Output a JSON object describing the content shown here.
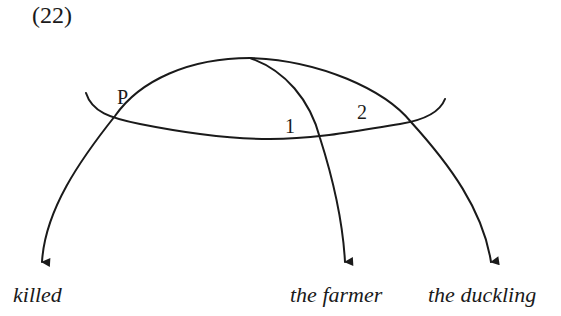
{
  "example": {
    "number": "(22)"
  },
  "diagram": {
    "labels": {
      "predicate": "P",
      "arg1": "1",
      "arg2": "2"
    },
    "words": [
      {
        "id": "killed",
        "text": "killed"
      },
      {
        "id": "farmer",
        "text": "the farmer"
      },
      {
        "id": "duckling",
        "text": "the duckling"
      }
    ],
    "colors": {
      "stroke": "#1a1a1a",
      "background": "#ffffff"
    }
  }
}
